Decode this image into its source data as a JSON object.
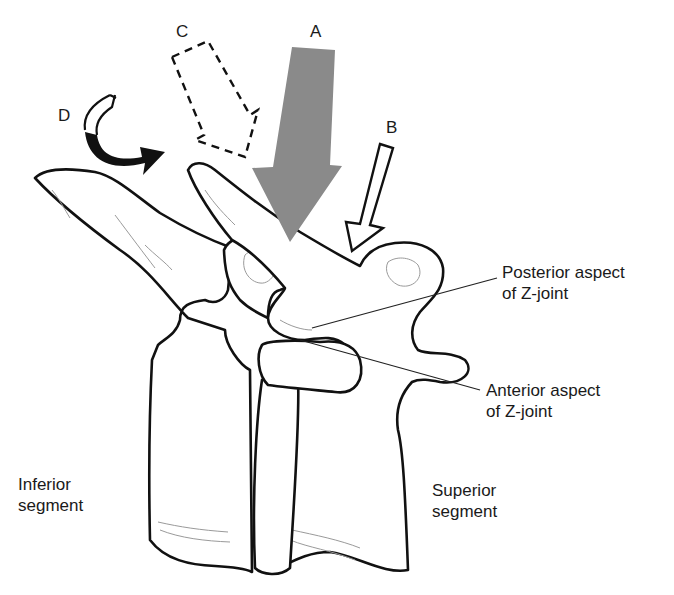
{
  "figure": {
    "arrows": [
      {
        "id": "A",
        "label": "A",
        "style": "solid gray filled, vertical downward",
        "color": "#8a8a8a"
      },
      {
        "id": "B",
        "label": "B",
        "style": "white outlined, oblique downward-left",
        "color": "#ffffff"
      },
      {
        "id": "C",
        "label": "C",
        "style": "dashed outline, oblique downward-right",
        "color": "#ffffff"
      },
      {
        "id": "D",
        "label": "D",
        "style": "curved, black tail to the right (rotation)",
        "color": "#111111"
      }
    ],
    "annotations": {
      "posterior": {
        "line1": "Posterior aspect",
        "line2": "of Z-joint"
      },
      "anterior": {
        "line1": "Anterior aspect",
        "line2": "of Z-joint"
      },
      "inferior": {
        "line1": "Inferior",
        "line2": "segment"
      },
      "superior": {
        "line1": "Superior",
        "line2": "segment"
      }
    }
  }
}
